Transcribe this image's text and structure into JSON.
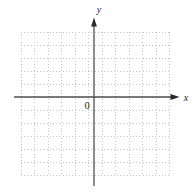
{
  "figure": {
    "x_label": "x",
    "y_label": "y",
    "origin_label": "0"
  },
  "colors": {
    "background": "#ffffff",
    "grid": "#c4c4c4",
    "axis": "#4f4f4f",
    "label": "#1c1c1c"
  },
  "chart_data": {
    "type": "scatter",
    "title": "",
    "xlabel": "x",
    "ylabel": "y",
    "origin_label": "0",
    "series": [],
    "points": [],
    "annotations": [
      "empty coordinate plane, no data points or tick labels shown"
    ],
    "grid": {
      "visible": true,
      "style": "dotted",
      "columns": 11,
      "rows": 11
    },
    "axes": {
      "arrows": [
        "+x",
        "+y"
      ],
      "x_axis_rows_above": 5,
      "x_axis_rows_below": 6,
      "y_axis_position": "between columns 5 and 6 (slightly right of grid center)",
      "x_range_cells": [
        -5.5,
        5.5
      ],
      "y_range_cells": [
        -6,
        5
      ]
    }
  }
}
